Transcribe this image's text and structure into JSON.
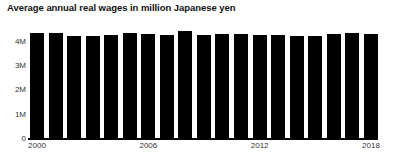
{
  "chart_data": {
    "type": "bar",
    "title": "Average annual real wages in million Japanese yen",
    "xlabel": "",
    "ylabel": "",
    "grid": false,
    "legend": false,
    "ylim": [
      0,
      4600000
    ],
    "ytick_labels": [
      "0",
      "1M",
      "2M",
      "3M",
      "4M"
    ],
    "ytick_values": [
      0,
      1000000,
      2000000,
      3000000,
      4000000
    ],
    "xtick_labels": [
      "2000",
      "2006",
      "2012",
      "2018"
    ],
    "xtick_categories": [
      "2000",
      "2006",
      "2012",
      "2018"
    ],
    "categories": [
      "2000",
      "2001",
      "2002",
      "2003",
      "2004",
      "2005",
      "2006",
      "2007",
      "2008",
      "2009",
      "2010",
      "2011",
      "2012",
      "2013",
      "2014",
      "2015",
      "2016",
      "2017",
      "2018"
    ],
    "values": [
      4320000,
      4310000,
      4200000,
      4210000,
      4220000,
      4300000,
      4260000,
      4250000,
      4400000,
      4240000,
      4270000,
      4280000,
      4250000,
      4240000,
      4180000,
      4200000,
      4260000,
      4300000,
      4290000
    ],
    "bar_color": "#000000"
  },
  "colors": {
    "background": "#ffffff",
    "axis": "#000000",
    "text": "#111111",
    "tick_text": "#333333"
  }
}
